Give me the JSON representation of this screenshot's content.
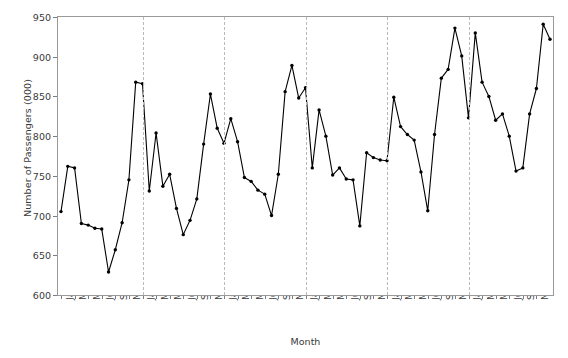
{
  "chart_data": {
    "type": "line",
    "title": "",
    "xlabel": "Month",
    "ylabel": "Number of Passengers (000)",
    "ylim": [
      600,
      950
    ],
    "yticks": [
      600,
      650,
      700,
      750,
      800,
      850,
      900,
      950
    ],
    "grid": "vertical-dashed-at-year-boundaries",
    "legend": "none",
    "marker": "filled-circle",
    "line_color": "#000000",
    "grid_color": "#b9b9b9",
    "axis_color": "#9a9a9a",
    "x": [
      "Jan 90",
      "Feb 90",
      "Mar 90",
      "Apr 90",
      "May 90",
      "Jun 90",
      "Jul 90",
      "Aug 90",
      "Sep 90",
      "Oct 90",
      "Nov 90",
      "Dec 90",
      "Jan 91",
      "Feb 91",
      "Mar 91",
      "Apr 91",
      "May 91",
      "Jun 91",
      "Jul 91",
      "Aug 91",
      "Sep 91",
      "Oct 91",
      "Nov 91",
      "Dec 91",
      "Jan 92",
      "Feb 92",
      "Mar 92",
      "Apr 92",
      "May 92",
      "Jun 92",
      "Jul 92",
      "Aug 92",
      "Sep 92",
      "Oct 92",
      "Nov 92",
      "Dec 92",
      "Jan 93",
      "Feb 93",
      "Mar 93",
      "Apr 93",
      "May 93",
      "Jun 93",
      "Jul 93",
      "Aug 93",
      "Sep 93",
      "Oct 93",
      "Nov 93",
      "Dec 93",
      "Jan 94",
      "Feb 94",
      "Mar 94",
      "Apr 94",
      "May 94",
      "Jun 94",
      "Jul 94",
      "Aug 94",
      "Sep 94",
      "Oct 94",
      "Nov 94",
      "Dec 94",
      "Jan 95",
      "Feb 95",
      "Mar 95",
      "Apr 95",
      "May 95",
      "Jun 95",
      "Jul 95",
      "Aug 95",
      "Sep 95",
      "Oct 95",
      "Nov 95",
      "Dec 95"
    ],
    "xtick_labels": [
      "Jan 90",
      "Mar 90",
      "May 90",
      "Jul 90",
      "Sep 90",
      "Nov 90",
      "Jan 91",
      "Mar 91",
      "May 91",
      "Jul 91",
      "Sep 91",
      "Nov 91",
      "Jan 92",
      "Mar 92",
      "May 92",
      "Jul 92",
      "Sep 92",
      "Nov 92",
      "Jan 93",
      "Mar 93",
      "May 93",
      "Jul 93",
      "Sep 93",
      "Nov 93",
      "Jan 94",
      "Mar 94",
      "May 94",
      "Jul 94",
      "Sep 94",
      "Nov 94",
      "Jan 95",
      "Mar 95",
      "May 95",
      "Jul 95",
      "Sep 95",
      "Nov 95"
    ],
    "xtick_indices": [
      0,
      2,
      4,
      6,
      8,
      10,
      12,
      14,
      16,
      18,
      20,
      22,
      24,
      26,
      28,
      30,
      32,
      34,
      36,
      38,
      40,
      42,
      44,
      46,
      48,
      50,
      52,
      54,
      56,
      58,
      60,
      62,
      64,
      66,
      68,
      70
    ],
    "gridline_indices": [
      12,
      24,
      36,
      48,
      60
    ],
    "values": [
      705,
      762,
      760,
      690,
      688,
      684,
      683,
      629,
      657,
      691,
      745,
      868,
      866,
      731,
      804,
      737,
      752,
      709,
      676,
      694,
      721,
      790,
      853,
      810,
      791,
      822,
      793,
      748,
      743,
      732,
      727,
      700,
      752,
      856,
      889,
      848,
      861,
      760,
      833,
      800,
      751,
      760,
      746,
      745,
      687,
      779,
      773,
      770,
      769,
      849,
      812,
      802,
      795,
      755,
      706,
      802,
      873,
      884,
      936,
      901,
      823,
      930,
      868,
      850,
      820,
      828,
      800,
      756,
      760,
      828,
      860,
      941
    ],
    "values_last": 922,
    "series_name": "Number of Passengers (000)"
  }
}
